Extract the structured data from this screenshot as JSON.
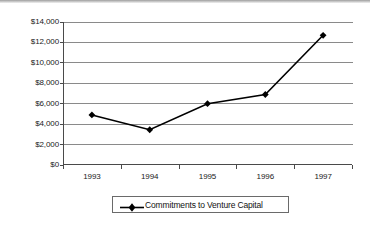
{
  "chart_data": {
    "type": "line",
    "title": "",
    "subtitle": "",
    "xlabel": "",
    "ylabel": "",
    "categories": [
      "1993",
      "1994",
      "1995",
      "1996",
      "1997"
    ],
    "series": [
      {
        "name": "Commitments to Venture Capital",
        "values": [
          4900,
          3450,
          6000,
          6900,
          12700
        ],
        "marker": "diamond",
        "color": "#000000"
      }
    ],
    "ylim": [
      0,
      14000
    ],
    "ytick_values": [
      0,
      2000,
      4000,
      6000,
      8000,
      10000,
      12000,
      14000
    ],
    "ytick_labels": [
      "$0",
      "$2,000",
      "$4,000",
      "$6,000",
      "$8,000",
      "$10,000",
      "$12,000",
      "$14,000"
    ],
    "xtick_labels": [
      "1993",
      "1994",
      "1995",
      "1996",
      "1997"
    ],
    "grid": "horizontal",
    "legend_position": "bottom-center",
    "legend_entries": [
      "Commitments to Venture Capital"
    ],
    "annotations": []
  },
  "legend": {
    "label": "Commitments to Venture Capital",
    "marker_icon": "diamond-marker-icon"
  },
  "colors": {
    "series_line": "#000000",
    "gridline": "#8a8a8a",
    "axis": "#4a4a4a",
    "text": "#1a1a1a",
    "background": "#ffffff"
  }
}
